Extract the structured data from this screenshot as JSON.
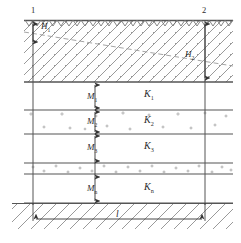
{
  "figure": {
    "type": "hydrogeological-cross-section",
    "width": 241,
    "height": 243,
    "colors": {
      "line": "#555555",
      "hatch": "#8a8a8a",
      "dash": "#9a9a9a",
      "text": "#2b2b2b",
      "background": "#ffffff"
    }
  },
  "wells": [
    {
      "id": "well-1",
      "label": "1",
      "x": 33,
      "head_label": "H",
      "head_sub": "1"
    },
    {
      "id": "well-2",
      "label": "2",
      "x": 205,
      "head_label": "H",
      "head_sub": "2"
    }
  ],
  "heads": [
    {
      "name": "H1",
      "base": "H",
      "sub": "1",
      "x": 44,
      "y": 26
    },
    {
      "name": "H2",
      "base": "H",
      "sub": "2",
      "x": 188,
      "y": 53
    }
  ],
  "layers": [
    {
      "index": 1,
      "thickness_label": "M",
      "thickness_sub": "1",
      "k_label": "K",
      "k_sub": "1",
      "fill": "clear",
      "y_top": 82,
      "y_bottom": 110
    },
    {
      "index": 2,
      "thickness_label": "M",
      "thickness_sub": "2",
      "k_label": "K",
      "k_sub": "2",
      "fill": "dotted",
      "y_top": 110,
      "y_bottom": 134
    },
    {
      "index": 3,
      "thickness_label": "M",
      "thickness_sub": "3",
      "k_label": "K",
      "k_sub": "3",
      "fill": "clear",
      "y_top": 134,
      "y_bottom": 163
    },
    {
      "index": 4,
      "thickness_label": "M",
      "thickness_sub": "n",
      "k_label": "K",
      "k_sub": "n",
      "fill": "dotted-top",
      "y_top": 174,
      "y_bottom": 203
    }
  ],
  "dimension": {
    "name": "distance",
    "label": "l",
    "x": 119,
    "y": 218
  },
  "surface": {
    "name": "ground-surface",
    "y": 20
  },
  "bedrock": {
    "name": "bedrock",
    "y": 203
  },
  "piezometric_line": {
    "name": "piezometric-surface",
    "style": "dashed",
    "x1": 24,
    "y1": 32,
    "x2": 233,
    "y2": 66
  }
}
